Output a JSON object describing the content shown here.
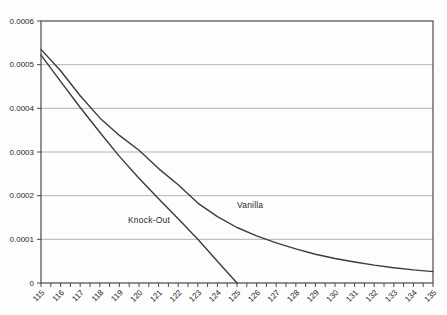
{
  "window": {
    "width": 447,
    "height": 315,
    "background": "#fdfdfd"
  },
  "chart_data": {
    "type": "line",
    "title": "",
    "xlabel": "",
    "ylabel": "",
    "xlim": [
      115,
      135
    ],
    "ylim": [
      0,
      0.0006
    ],
    "grid": "horizontal",
    "legend_position": "none-inline-annotations",
    "x_tick_labels": [
      "115",
      "116",
      "117",
      "118",
      "119",
      "120",
      "121",
      "122",
      "123",
      "124",
      "125",
      "126",
      "127",
      "128",
      "129",
      "130",
      "131",
      "132",
      "133",
      "134",
      "135"
    ],
    "x_minor_tick_step": 0.5,
    "y_tick_labels": [
      "0",
      "0.0001",
      "0.0002",
      "0.0003",
      "0.0004",
      "0.0005",
      "0.0006"
    ],
    "y_tick_values": [
      0,
      0.0001,
      0.0002,
      0.0003,
      0.0004,
      0.0005,
      0.0006
    ],
    "series": [
      {
        "name": "Vanilla",
        "x": [
          115,
          116,
          117,
          118,
          119,
          120,
          121,
          122,
          123,
          124,
          125,
          126,
          127,
          128,
          129,
          130,
          131,
          132,
          133,
          134,
          135
        ],
        "values": [
          0.000535,
          0.000486,
          0.000429,
          0.000378,
          0.000338,
          0.000304,
          0.000262,
          0.000225,
          0.000183,
          0.000152,
          0.000127,
          0.000108,
          9.2e-05,
          7.8e-05,
          6.6e-05,
          5.6e-05,
          4.8e-05,
          4.1e-05,
          3.5e-05,
          3e-05,
          2.6e-05
        ]
      },
      {
        "name": "Knock-Out",
        "x": [
          115,
          116,
          117,
          118,
          119,
          120,
          121,
          122,
          123,
          124,
          125
        ],
        "values": [
          0.000522,
          0.000462,
          0.000402,
          0.000345,
          0.00029,
          0.00024,
          0.000193,
          0.000147,
          0.0001,
          5e-05,
          0
        ]
      }
    ],
    "annotations": [
      {
        "text": "Knock-Out",
        "px": [
          128,
          215
        ]
      },
      {
        "text": "Vanilla",
        "px": [
          237,
          200
        ]
      }
    ],
    "colors": {
      "line": "#3c3c3c",
      "grid": "#b3b3b3",
      "axis": "#4a4a4a",
      "text": "#1f1f1f",
      "plot_bg": "#fdfdfd"
    }
  }
}
